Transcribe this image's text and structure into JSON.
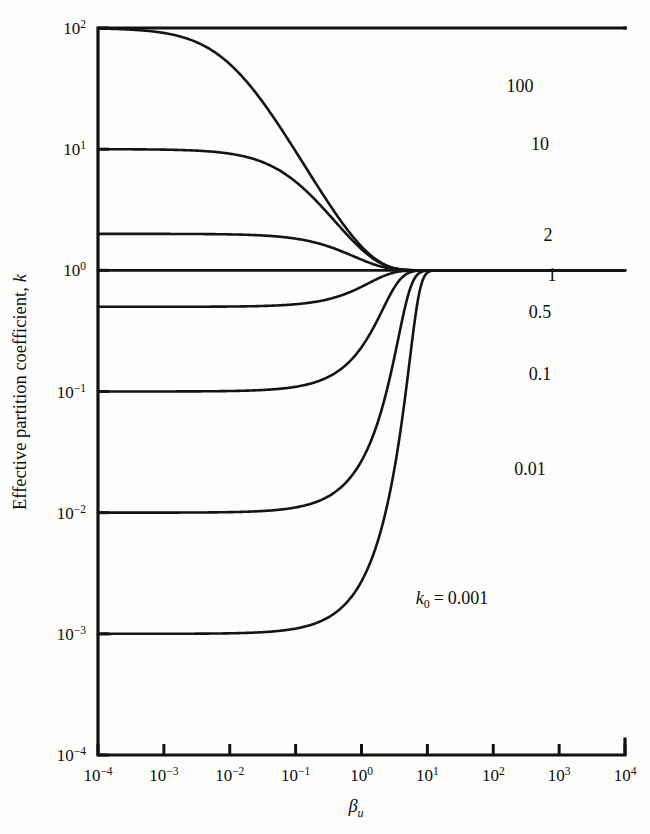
{
  "figure": {
    "background_color": "#fdfdfc",
    "ink_color": "#141414",
    "width": 650,
    "height": 834
  },
  "chart_data": {
    "type": "line",
    "title": "",
    "xlabel": "βu",
    "xlabel_parts": {
      "symbol": "β",
      "subscript": "u"
    },
    "ylabel": "Effective partition coefficient, k",
    "ylabel_parts": {
      "text": "Effective partition coefficient,",
      "italic_symbol": "k"
    },
    "xscale": "log",
    "yscale": "log",
    "xlim": [
      0.0001,
      10000
    ],
    "ylim": [
      0.0001,
      100
    ],
    "grid": false,
    "legend": "inline-curve-labels",
    "xticks": [
      0.0001,
      0.001,
      0.01,
      0.1,
      1,
      10,
      100,
      1000,
      10000
    ],
    "xtick_labels": [
      {
        "mantissa": "10",
        "exponent": "−4"
      },
      {
        "mantissa": "10",
        "exponent": "−3"
      },
      {
        "mantissa": "10",
        "exponent": "−2"
      },
      {
        "mantissa": "10",
        "exponent": "−1"
      },
      {
        "mantissa": "10",
        "exponent": "0"
      },
      {
        "mantissa": "10",
        "exponent": "1"
      },
      {
        "mantissa": "10",
        "exponent": "2"
      },
      {
        "mantissa": "10",
        "exponent": "3"
      },
      {
        "mantissa": "10",
        "exponent": "4"
      }
    ],
    "yticks": [
      0.0001,
      0.001,
      0.01,
      0.1,
      1,
      10,
      100
    ],
    "ytick_labels": [
      {
        "mantissa": "10",
        "exponent": "−4"
      },
      {
        "mantissa": "10",
        "exponent": "−3"
      },
      {
        "mantissa": "10",
        "exponent": "−2"
      },
      {
        "mantissa": "10",
        "exponent": "−1"
      },
      {
        "mantissa": "10",
        "exponent": "0"
      },
      {
        "mantissa": "10",
        "exponent": "1"
      },
      {
        "mantissa": "10",
        "exponent": "2"
      }
    ],
    "model": {
      "name": "Burton-Prim-Slichter effective distribution coefficient",
      "formula": "k = k0 / (k0 + (1 - k0) * exp(-beta_u))"
    },
    "series": [
      {
        "name": "k0-100",
        "k0": 100,
        "label": "100",
        "label_x": 520,
        "label_y": 92,
        "x": [
          0.0001,
          0.001,
          0.01,
          0.1,
          0.3,
          1,
          3,
          10,
          100,
          1000,
          10000
        ],
        "y": [
          1.0,
          1.0,
          1.01,
          1.1,
          1.32,
          2.06,
          7.6,
          50.5,
          99.0,
          99.9,
          100.0
        ],
        "y_at_xmax_visible": 50
      },
      {
        "name": "k0-10",
        "k0": 10,
        "label": "10",
        "label_x": 540,
        "label_y": 150,
        "x": [
          0.0001,
          0.001,
          0.01,
          0.1,
          0.3,
          1,
          3,
          10,
          100,
          1000,
          10000
        ],
        "y": [
          1.0,
          1.0,
          1.01,
          1.09,
          1.28,
          1.82,
          4.02,
          9.6,
          10.0,
          10.0,
          10.0
        ],
        "y_at_xmax_visible": 9.8
      },
      {
        "name": "k0-2",
        "k0": 2,
        "label": "2",
        "label_x": 548,
        "label_y": 241,
        "x": [
          0.0001,
          0.001,
          0.01,
          0.1,
          0.3,
          1,
          3,
          10,
          100,
          1000,
          10000
        ],
        "y": [
          1.0,
          1.0,
          1.005,
          1.05,
          1.15,
          1.4,
          1.81,
          1.99,
          2.0,
          2.0,
          2.0
        ],
        "y_at_xmax_visible": 2.0
      },
      {
        "name": "k0-1",
        "k0": 1,
        "label": "1",
        "label_x": 552,
        "label_y": 281,
        "x": [
          0.0001,
          0.001,
          0.01,
          0.1,
          1,
          10,
          100,
          1000,
          10000
        ],
        "y": [
          1.0,
          1.0,
          1.0,
          1.0,
          1.0,
          1.0,
          1.0,
          1.0,
          1.0
        ],
        "y_at_xmax_visible": 1.0
      },
      {
        "name": "k0-0.5",
        "k0": 0.5,
        "label": "0.5",
        "label_x": 540,
        "label_y": 318,
        "x": [
          0.0001,
          0.001,
          0.01,
          0.1,
          0.3,
          1,
          3,
          10,
          100,
          1000,
          10000
        ],
        "y": [
          1.0,
          1.0,
          0.9975,
          0.976,
          0.935,
          0.859,
          0.68,
          0.52,
          0.5,
          0.5,
          0.5
        ],
        "y_at_xmax_visible": 0.5
      },
      {
        "name": "k0-0.1",
        "k0": 0.1,
        "label": "0.1",
        "label_x": 540,
        "label_y": 380,
        "x": [
          0.0001,
          0.001,
          0.01,
          0.1,
          0.3,
          1,
          3,
          10,
          100,
          1000,
          10000
        ],
        "y": [
          1.0,
          0.9991,
          0.991,
          0.92,
          0.795,
          0.57,
          0.215,
          0.105,
          0.1,
          0.1,
          0.1
        ],
        "y_at_xmax_visible": 0.1
      },
      {
        "name": "k0-0.01",
        "k0": 0.01,
        "label": "0.01",
        "label_x": 530,
        "label_y": 475,
        "x": [
          0.0001,
          0.001,
          0.01,
          0.1,
          0.3,
          1,
          3,
          10,
          100,
          1000,
          10000
        ],
        "y": [
          0.9999,
          0.999,
          0.99,
          0.907,
          0.743,
          0.37,
          0.055,
          0.0105,
          0.01,
          0.01,
          0.01
        ],
        "y_at_xmax_visible": 0.01
      },
      {
        "name": "k0-0.001",
        "k0": 0.001,
        "label": "k0 = 0.001",
        "label_parts": {
          "italic_symbol": "k",
          "subscript": "0",
          "equals": "=",
          "value": "0.001"
        },
        "label_x": 452,
        "label_y": 604,
        "x": [
          0.0001,
          0.001,
          0.01,
          0.1,
          0.3,
          1,
          3,
          10,
          100,
          1000,
          10000
        ],
        "y": [
          0.9999,
          0.999,
          0.99,
          0.905,
          0.737,
          0.35,
          0.02,
          0.0011,
          0.001,
          0.001,
          0.001
        ],
        "y_at_xmax_visible": 0.00105
      }
    ]
  },
  "geometry": {
    "plot_left": 98,
    "plot_right": 625,
    "plot_top": 28,
    "plot_bottom": 755,
    "tick_length": 11
  }
}
